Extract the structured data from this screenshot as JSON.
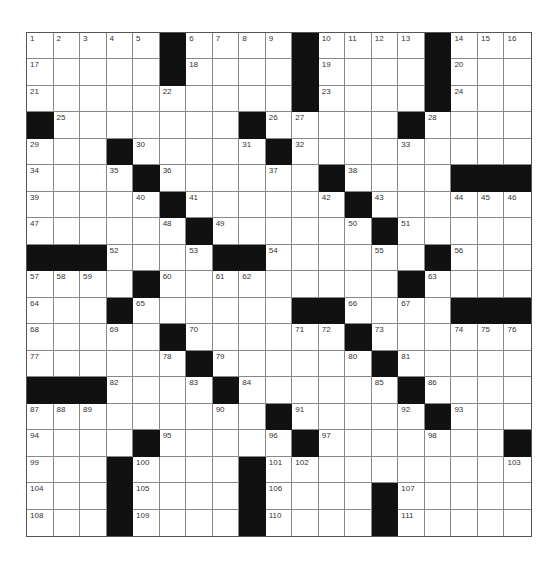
{
  "puzzle": {
    "rows": 19,
    "cols": 19,
    "colors": {
      "block": "#111111",
      "cell": "#ffffff",
      "grid_line": "#888888",
      "number": "#333333"
    },
    "grid": [
      ".....#....#....#...",
      ".....#....#....#...",
      "..........#....#...",
      "#.......#.....#....",
      "...#....#..........",
      "...#.....#.#....###",
      ".....#.....#.......",
      "......#.....#......",
      "###......##....#...",
      "....#...........#..",
      "...#......##.....###",
      ".....#......#......",
      "......#.....#......",
      "###.....#....#.....",
      ".........#....#....",
      "....#....#.......#",
      "...#....#.........",
      "...#....#...#.....",
      "...#....#...#....."
    ],
    "blocks": [
      [
        0,
        5
      ],
      [
        0,
        10
      ],
      [
        0,
        15
      ],
      [
        1,
        5
      ],
      [
        1,
        10
      ],
      [
        1,
        15
      ],
      [
        2,
        10
      ],
      [
        2,
        15
      ],
      [
        3,
        0
      ],
      [
        3,
        8
      ],
      [
        3,
        14
      ],
      [
        4,
        3
      ],
      [
        4,
        9
      ],
      [
        5,
        4
      ],
      [
        5,
        11
      ],
      [
        5,
        16
      ],
      [
        5,
        17
      ],
      [
        5,
        18
      ],
      [
        6,
        5
      ],
      [
        6,
        12
      ],
      [
        7,
        6
      ],
      [
        7,
        13
      ],
      [
        8,
        0
      ],
      [
        8,
        1
      ],
      [
        8,
        2
      ],
      [
        8,
        7
      ],
      [
        8,
        8
      ],
      [
        8,
        15
      ],
      [
        9,
        4
      ],
      [
        9,
        14
      ],
      [
        10,
        3
      ],
      [
        10,
        10
      ],
      [
        10,
        11
      ],
      [
        10,
        16
      ],
      [
        10,
        17
      ],
      [
        10,
        18
      ],
      [
        11,
        5
      ],
      [
        11,
        12
      ],
      [
        12,
        6
      ],
      [
        12,
        13
      ],
      [
        13,
        0
      ],
      [
        13,
        1
      ],
      [
        13,
        2
      ],
      [
        13,
        7
      ],
      [
        13,
        14
      ],
      [
        14,
        9
      ],
      [
        14,
        15
      ],
      [
        15,
        4
      ],
      [
        15,
        10
      ],
      [
        15,
        18
      ],
      [
        16,
        3
      ],
      [
        16,
        8
      ],
      [
        17,
        3
      ],
      [
        17,
        8
      ],
      [
        17,
        13
      ],
      [
        18,
        3
      ],
      [
        18,
        8
      ],
      [
        18,
        13
      ]
    ],
    "numbers": [
      {
        "n": "1",
        "r": 0,
        "c": 0
      },
      {
        "n": "2",
        "r": 0,
        "c": 1
      },
      {
        "n": "3",
        "r": 0,
        "c": 2
      },
      {
        "n": "4",
        "r": 0,
        "c": 3
      },
      {
        "n": "5",
        "r": 0,
        "c": 4
      },
      {
        "n": "6",
        "r": 0,
        "c": 6
      },
      {
        "n": "7",
        "r": 0,
        "c": 7
      },
      {
        "n": "8",
        "r": 0,
        "c": 8
      },
      {
        "n": "9",
        "r": 0,
        "c": 9
      },
      {
        "n": "10",
        "r": 0,
        "c": 11
      },
      {
        "n": "11",
        "r": 0,
        "c": 12
      },
      {
        "n": "12",
        "r": 0,
        "c": 13
      },
      {
        "n": "13",
        "r": 0,
        "c": 14
      },
      {
        "n": "14",
        "r": 0,
        "c": 16
      },
      {
        "n": "15",
        "r": 0,
        "c": 17
      },
      {
        "n": "16",
        "r": 0,
        "c": 18
      },
      {
        "n": "17",
        "r": 1,
        "c": 0
      },
      {
        "n": "18",
        "r": 1,
        "c": 6
      },
      {
        "n": "19",
        "r": 1,
        "c": 11
      },
      {
        "n": "20",
        "r": 1,
        "c": 16
      },
      {
        "n": "21",
        "r": 2,
        "c": 0
      },
      {
        "n": "22",
        "r": 2,
        "c": 5
      },
      {
        "n": "23",
        "r": 2,
        "c": 11
      },
      {
        "n": "24",
        "r": 2,
        "c": 16
      },
      {
        "n": "25",
        "r": 3,
        "c": 1
      },
      {
        "n": "26",
        "r": 3,
        "c": 9
      },
      {
        "n": "27",
        "r": 3,
        "c": 10
      },
      {
        "n": "28",
        "r": 3,
        "c": 15
      },
      {
        "n": "29",
        "r": 4,
        "c": 0
      },
      {
        "n": "30",
        "r": 4,
        "c": 4
      },
      {
        "n": "31",
        "r": 4,
        "c": 8
      },
      {
        "n": "32",
        "r": 4,
        "c": 10
      },
      {
        "n": "33",
        "r": 4,
        "c": 14
      },
      {
        "n": "34",
        "r": 5,
        "c": 0
      },
      {
        "n": "35",
        "r": 5,
        "c": 3
      },
      {
        "n": "36",
        "r": 5,
        "c": 5
      },
      {
        "n": "37",
        "r": 5,
        "c": 9
      },
      {
        "n": "38",
        "r": 5,
        "c": 12
      },
      {
        "n": "39",
        "r": 6,
        "c": 0
      },
      {
        "n": "40",
        "r": 6,
        "c": 4
      },
      {
        "n": "41",
        "r": 6,
        "c": 6
      },
      {
        "n": "42",
        "r": 6,
        "c": 11
      },
      {
        "n": "43",
        "r": 6,
        "c": 13
      },
      {
        "n": "44",
        "r": 6,
        "c": 16
      },
      {
        "n": "45",
        "r": 6,
        "c": 17
      },
      {
        "n": "46",
        "r": 6,
        "c": 18
      },
      {
        "n": "47",
        "r": 7,
        "c": 0
      },
      {
        "n": "48",
        "r": 7,
        "c": 5
      },
      {
        "n": "49",
        "r": 7,
        "c": 7
      },
      {
        "n": "50",
        "r": 7,
        "c": 12
      },
      {
        "n": "51",
        "r": 7,
        "c": 14
      },
      {
        "n": "52",
        "r": 8,
        "c": 3
      },
      {
        "n": "53",
        "r": 8,
        "c": 6
      },
      {
        "n": "54",
        "r": 8,
        "c": 9
      },
      {
        "n": "55",
        "r": 8,
        "c": 13
      },
      {
        "n": "56",
        "r": 8,
        "c": 16
      },
      {
        "n": "57",
        "r": 9,
        "c": 0
      },
      {
        "n": "58",
        "r": 9,
        "c": 1
      },
      {
        "n": "59",
        "r": 9,
        "c": 2
      },
      {
        "n": "60",
        "r": 9,
        "c": 5
      },
      {
        "n": "61",
        "r": 9,
        "c": 7
      },
      {
        "n": "62",
        "r": 9,
        "c": 8
      },
      {
        "n": "63",
        "r": 9,
        "c": 15
      },
      {
        "n": "64",
        "r": 10,
        "c": 0
      },
      {
        "n": "65",
        "r": 10,
        "c": 4
      },
      {
        "n": "66",
        "r": 10,
        "c": 12
      },
      {
        "n": "67",
        "r": 10,
        "c": 14
      },
      {
        "n": "68",
        "r": 11,
        "c": 0
      },
      {
        "n": "69",
        "r": 11,
        "c": 3
      },
      {
        "n": "70",
        "r": 11,
        "c": 6
      },
      {
        "n": "71",
        "r": 11,
        "c": 10
      },
      {
        "n": "72",
        "r": 11,
        "c": 11
      },
      {
        "n": "73",
        "r": 11,
        "c": 13
      },
      {
        "n": "74",
        "r": 11,
        "c": 16
      },
      {
        "n": "75",
        "r": 11,
        "c": 17
      },
      {
        "n": "76",
        "r": 11,
        "c": 18
      },
      {
        "n": "77",
        "r": 12,
        "c": 0
      },
      {
        "n": "78",
        "r": 12,
        "c": 5
      },
      {
        "n": "79",
        "r": 12,
        "c": 7
      },
      {
        "n": "80",
        "r": 12,
        "c": 12
      },
      {
        "n": "81",
        "r": 12,
        "c": 14
      },
      {
        "n": "82",
        "r": 13,
        "c": 3
      },
      {
        "n": "83",
        "r": 13,
        "c": 6
      },
      {
        "n": "84",
        "r": 13,
        "c": 8
      },
      {
        "n": "85",
        "r": 13,
        "c": 13
      },
      {
        "n": "86",
        "r": 13,
        "c": 15
      },
      {
        "n": "87",
        "r": 14,
        "c": 0
      },
      {
        "n": "88",
        "r": 14,
        "c": 1
      },
      {
        "n": "89",
        "r": 14,
        "c": 2
      },
      {
        "n": "90",
        "r": 14,
        "c": 7
      },
      {
        "n": "91",
        "r": 14,
        "c": 10
      },
      {
        "n": "92",
        "r": 14,
        "c": 14
      },
      {
        "n": "93",
        "r": 14,
        "c": 16
      },
      {
        "n": "94",
        "r": 15,
        "c": 0
      },
      {
        "n": "95",
        "r": 15,
        "c": 5
      },
      {
        "n": "96",
        "r": 15,
        "c": 9
      },
      {
        "n": "97",
        "r": 15,
        "c": 11
      },
      {
        "n": "98",
        "r": 15,
        "c": 15
      },
      {
        "n": "99",
        "r": 16,
        "c": 0
      },
      {
        "n": "100",
        "r": 16,
        "c": 4
      },
      {
        "n": "101",
        "r": 16,
        "c": 9
      },
      {
        "n": "102",
        "r": 16,
        "c": 10
      },
      {
        "n": "103",
        "r": 16,
        "c": 18
      },
      {
        "n": "104",
        "r": 17,
        "c": 0
      },
      {
        "n": "105",
        "r": 17,
        "c": 4
      },
      {
        "n": "106",
        "r": 17,
        "c": 9
      },
      {
        "n": "107",
        "r": 17,
        "c": 14
      },
      {
        "n": "108",
        "r": 18,
        "c": 0
      },
      {
        "n": "109",
        "r": 18,
        "c": 4
      },
      {
        "n": "110",
        "r": 18,
        "c": 9
      },
      {
        "n": "111",
        "r": 18,
        "c": 14
      }
    ]
  }
}
